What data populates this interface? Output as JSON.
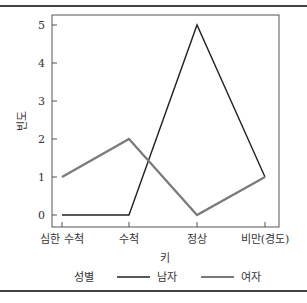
{
  "chart_data": {
    "type": "line",
    "title": "",
    "xlabel": "키",
    "ylabel": "빈도",
    "categories": [
      "심한 수척",
      "수척",
      "정상",
      "비만(경도)"
    ],
    "series": [
      {
        "name": "남자",
        "color": "#222222",
        "values": [
          0,
          0,
          5,
          1
        ]
      },
      {
        "name": "여자",
        "color": "#7a7a7a",
        "values": [
          1,
          2,
          0,
          1
        ]
      }
    ],
    "yticks": [
      0,
      1,
      2,
      3,
      4,
      5
    ],
    "ylim": [
      0,
      5
    ],
    "grid": false,
    "legend": {
      "title": "성별",
      "position": "bottom"
    }
  }
}
